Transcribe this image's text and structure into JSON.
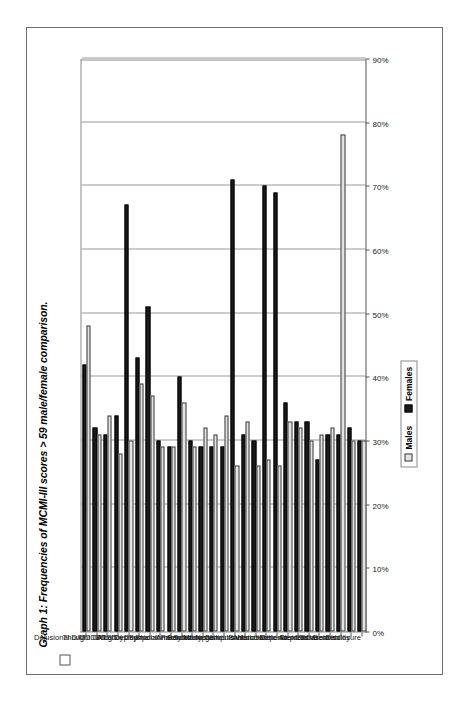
{
  "figure": {
    "title": "Graph 1: Frequencies of MCMI-III scores > 59 male/female comparison.",
    "title_legend_swatch": "empty-square",
    "frame_color": "#6d6d6d",
    "background": "#ffffff",
    "orientation": "rotated-90-ccw"
  },
  "legend": {
    "position": "bottom-center",
    "entries": [
      {
        "label": "Males",
        "color": "#e3e3e3",
        "swatch": "light-square"
      },
      {
        "label": "Females",
        "color": "#1a1a1a",
        "swatch": "black-square"
      }
    ]
  },
  "axis": {
    "tick_labels": [
      "0%",
      "10%",
      "20%",
      "30%",
      "40%",
      "50%",
      "60%",
      "70%",
      "80%",
      "90%"
    ],
    "min": 0,
    "max": 90,
    "unit": "%"
  },
  "chart_data": {
    "type": "bar",
    "orientation": "horizontal",
    "title": "Graph 1: Frequencies of MCMI-III scores > 59 male/female comparison.",
    "xlabel": "",
    "ylabel": "",
    "xlim": [
      0,
      90
    ],
    "grid": true,
    "legend_position": "bottom-center",
    "tick_labels": [
      "0%",
      "10%",
      "20%",
      "30%",
      "40%",
      "50%",
      "60%",
      "70%",
      "80%",
      "90%"
    ],
    "categories": [
      "Disclosure",
      "Desirability",
      "Debasement",
      "Schizoid",
      "Depressive",
      "Avoidant",
      "Dependent",
      "Histrionic",
      "Narcissistic",
      "Antisocial",
      "Sadistic",
      "Compulsive",
      "Negativistic",
      "Masochistic",
      "Schizotypal",
      "Borderline",
      "Paranoid",
      "Anxiety",
      "Somatoform",
      "Bipolar",
      "Dysthymic",
      "Alcohol Dep",
      "Drug Dep",
      "PTSD",
      "Thought D/O",
      "MDD",
      "Delusional D/O"
    ],
    "series": [
      {
        "name": "Males",
        "color": "#e3e3e3",
        "values": [
          30,
          30,
          78,
          32,
          31,
          30,
          32,
          33,
          26,
          27,
          26,
          33,
          26,
          34,
          31,
          32,
          29,
          36,
          29,
          29,
          37,
          39,
          30,
          28,
          34,
          31,
          48
        ]
      },
      {
        "name": "Females",
        "color": "#1a1a1a",
        "values": [
          30,
          32,
          31,
          31,
          27,
          33,
          33,
          36,
          69,
          70,
          30,
          31,
          71,
          29,
          29,
          29,
          30,
          40,
          29,
          30,
          51,
          43,
          67,
          34,
          31,
          32,
          42
        ]
      }
    ]
  }
}
